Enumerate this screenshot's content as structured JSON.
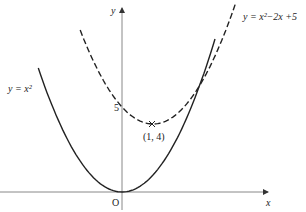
{
  "diagram": {
    "axes": {
      "x_label": "x",
      "y_label": "y",
      "origin_label": "O"
    },
    "curves": [
      {
        "name": "y = x^2",
        "label": "y = x²",
        "style": "solid",
        "a": 1,
        "b": 0,
        "c": 0
      },
      {
        "name": "y = x^2 - 2x + 5",
        "label": "y = x²−2x +5",
        "style": "dashed",
        "a": 1,
        "b": -2,
        "c": 5
      }
    ],
    "annotations": {
      "y_intercept_label": "5",
      "vertex_label": "(1, 4)",
      "vertex": [
        1,
        4
      ]
    },
    "colors": {
      "curve": "#222222",
      "axis": "#888888"
    }
  }
}
